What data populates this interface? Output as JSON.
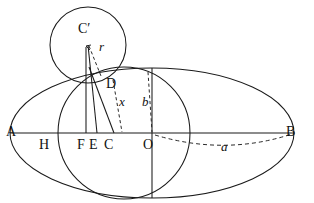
{
  "figure": {
    "type": "geometry-diagram",
    "background_color": "#ffffff",
    "line_color": "#1a1a1a",
    "width": 314,
    "height": 203
  },
  "labels": {
    "vertex_a": "A",
    "vertex_b": "B",
    "point_h": "H",
    "point_f": "F",
    "point_e": "E",
    "point_c": "C",
    "point_o": "O",
    "point_d": "D",
    "center_c_prime": "C′",
    "radius_r": "r",
    "segment_x": "x",
    "semi_minor_b": "b",
    "semi_major_a": "a"
  },
  "geometry": {
    "ellipse": {
      "center": [
        152,
        133
      ],
      "semi_major_axis_px": 142,
      "semi_minor_axis_px": 65
    },
    "big_circle": {
      "center": [
        124,
        133
      ],
      "radius_px": 66
    },
    "small_circle": {
      "center": [
        88,
        45
      ],
      "radius_px": 38
    },
    "axis_points": {
      "A": [
        10,
        133
      ],
      "H": [
        58,
        133
      ],
      "F": [
        86,
        133
      ],
      "E": [
        97,
        133
      ],
      "C": [
        114,
        133
      ],
      "O": [
        152,
        133
      ],
      "B": [
        294,
        133
      ]
    },
    "D": [
      100,
      76
    ]
  }
}
